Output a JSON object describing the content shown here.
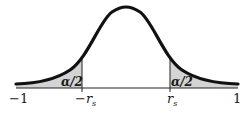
{
  "diagram": {
    "type": "normal-distribution-two-tailed",
    "colors": {
      "curve": "#111111",
      "shade": "#d4d4d4",
      "axis": "#222222",
      "background": "#ffffff"
    },
    "axis_labels": {
      "left": "−1",
      "neg_critical": "−r",
      "neg_critical_sub": "s",
      "pos_critical": "r",
      "pos_critical_sub": "s",
      "right": "1"
    },
    "tail_labels": {
      "left": "α/2",
      "right": "α/2"
    }
  }
}
